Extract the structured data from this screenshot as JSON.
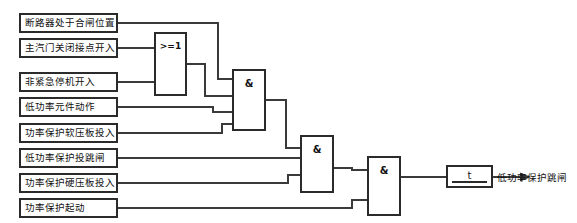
{
  "diagram": {
    "type": "logic-diagram",
    "background_color": "#ffffff",
    "line_color": "#3a3a3a",
    "box_border_color": "#2b2b2b",
    "text_color": "#111111"
  },
  "inputs": [
    {
      "id": "in1",
      "label": "断路器处于合闸位置",
      "x": 20,
      "y": 14,
      "w": 97,
      "h": 18
    },
    {
      "id": "in2",
      "label": "主汽门关闭接点开入",
      "x": 20,
      "y": 39,
      "w": 97,
      "h": 18
    },
    {
      "id": "in3",
      "label": "非紧急停机开入",
      "x": 20,
      "y": 73,
      "w": 97,
      "h": 18
    },
    {
      "id": "in4",
      "label": "低功率元件动作",
      "x": 20,
      "y": 98,
      "w": 97,
      "h": 18
    },
    {
      "id": "in5",
      "label": "功率保护软压板投入",
      "x": 20,
      "y": 124,
      "w": 97,
      "h": 18
    },
    {
      "id": "in6",
      "label": "低功率保护投跳闸",
      "x": 20,
      "y": 149,
      "w": 97,
      "h": 18
    },
    {
      "id": "in7",
      "label": "功率保护硬压板投入",
      "x": 20,
      "y": 174,
      "w": 97,
      "h": 18
    },
    {
      "id": "in8",
      "label": "功率保护起动",
      "x": 20,
      "y": 199,
      "w": 97,
      "h": 18
    }
  ],
  "gates": [
    {
      "id": "or1",
      "symbol": ">=1",
      "kind": "or",
      "x": 155,
      "y": 33,
      "w": 31,
      "h": 62,
      "inputs": 2
    },
    {
      "id": "and1",
      "symbol": "&",
      "kind": "and",
      "x": 233,
      "y": 70,
      "w": 32,
      "h": 60,
      "inputs": 4
    },
    {
      "id": "and2",
      "symbol": "&",
      "kind": "and",
      "x": 301,
      "y": 136,
      "w": 32,
      "h": 56,
      "inputs": 3
    },
    {
      "id": "and3",
      "symbol": "&",
      "kind": "and",
      "x": 368,
      "y": 157,
      "w": 32,
      "h": 58,
      "inputs": 2
    }
  ],
  "timer": {
    "id": "timer1",
    "symbol": "t",
    "x": 447,
    "y": 166,
    "w": 45,
    "h": 21
  },
  "output": {
    "id": "out1",
    "label": "低功率保护跳闸",
    "x": 497,
    "y": 170
  },
  "wires": [
    {
      "id": "w-in1-and1",
      "d": "M117 23 L218 23 L218 79 L233 79"
    },
    {
      "id": "w-in2-or1",
      "d": "M117 48 L155 48"
    },
    {
      "id": "w-in3-or1",
      "d": "M117 82 L155 82"
    },
    {
      "id": "w-or1-and1",
      "d": "M186 64 L205 64 L205 96 L233 96"
    },
    {
      "id": "w-in4-and1",
      "d": "M117 107 L213 107 L213 112 L233 112"
    },
    {
      "id": "w-in5-and1",
      "d": "M117 133 L222 133 L222 124 L233 124"
    },
    {
      "id": "w-and1-and2",
      "d": "M265 100 L286 100 L286 148 L301 148"
    },
    {
      "id": "w-in6-and2",
      "d": "M117 158 L301 158"
    },
    {
      "id": "w-in7-and2",
      "d": "M117 183 L288 183 L288 175 L301 175"
    },
    {
      "id": "w-and2-and3",
      "d": "M333 168 L352 168 L352 170 L368 170"
    },
    {
      "id": "w-in8-and3",
      "d": "M117 208 L352 208 L352 200 L368 200"
    },
    {
      "id": "w-and3-timer",
      "d": "M400 177 L447 177"
    },
    {
      "id": "w-timer-out",
      "d": "M492 177 L520 177"
    }
  ]
}
